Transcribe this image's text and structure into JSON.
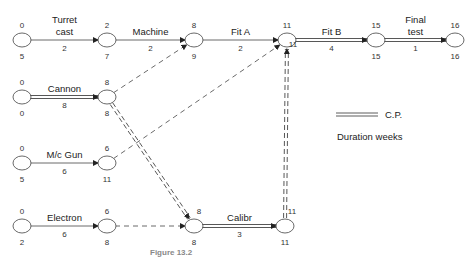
{
  "nodes": [
    {
      "id": "n1",
      "early": "0",
      "late": "5"
    },
    {
      "id": "n2",
      "early": "2",
      "late": "7"
    },
    {
      "id": "n3",
      "early": "8",
      "late": "9"
    },
    {
      "id": "n4",
      "early": "11",
      "late": "11"
    },
    {
      "id": "n5",
      "early": "15",
      "late": "15"
    },
    {
      "id": "n6",
      "early": "16",
      "late": "16"
    },
    {
      "id": "n7",
      "early": "0",
      "late": "0"
    },
    {
      "id": "n8",
      "early": "8",
      "late": "8"
    },
    {
      "id": "n9",
      "early": "0",
      "late": "5"
    },
    {
      "id": "n10",
      "early": "6",
      "late": "11"
    },
    {
      "id": "n11",
      "early": "0",
      "late": "2"
    },
    {
      "id": "n12",
      "early": "6",
      "late": "8"
    },
    {
      "id": "n13",
      "early": "8",
      "late": "8"
    },
    {
      "id": "n14",
      "early": "11",
      "late": "11"
    }
  ],
  "activities": [
    {
      "from": "n1",
      "to": "n2",
      "label_line1": "Turret",
      "label_line2": "cast",
      "duration": "2",
      "type": "normal"
    },
    {
      "from": "n2",
      "to": "n3",
      "label_line1": "Machine",
      "label_line2": "",
      "duration": "2",
      "type": "normal"
    },
    {
      "from": "n3",
      "to": "n4",
      "label_line1": "Fit A",
      "label_line2": "",
      "duration": "2",
      "type": "normal"
    },
    {
      "from": "n4",
      "to": "n5",
      "label_line1": "Fit B",
      "label_line2": "",
      "duration": "4",
      "type": "critical"
    },
    {
      "from": "n5",
      "to": "n6",
      "label_line1": "Final",
      "label_line2": "test",
      "duration": "1",
      "type": "critical"
    },
    {
      "from": "n7",
      "to": "n8",
      "label_line1": "Cannon",
      "label_line2": "",
      "duration": "8",
      "type": "critical"
    },
    {
      "from": "n9",
      "to": "n10",
      "label_line1": "M/c Gun",
      "label_line2": "",
      "duration": "6",
      "type": "normal"
    },
    {
      "from": "n11",
      "to": "n12",
      "label_line1": "Electron",
      "label_line2": "",
      "duration": "6",
      "type": "normal"
    },
    {
      "from": "n13",
      "to": "n14",
      "label_line1": "Calibr",
      "label_line2": "",
      "duration": "3",
      "type": "critical"
    },
    {
      "from": "n8",
      "to": "n3",
      "type": "dummy"
    },
    {
      "from": "n10",
      "to": "n4",
      "type": "dummy"
    },
    {
      "from": "n8",
      "to": "n13",
      "type": "dummy-critical"
    },
    {
      "from": "n12",
      "to": "n13",
      "type": "dummy"
    },
    {
      "from": "n14",
      "to": "n4",
      "type": "dummy-critical"
    }
  ],
  "legend": {
    "critical_path_label": "C.P.",
    "duration_note": "Duration weeks"
  },
  "caption": "Figure 13.2"
}
